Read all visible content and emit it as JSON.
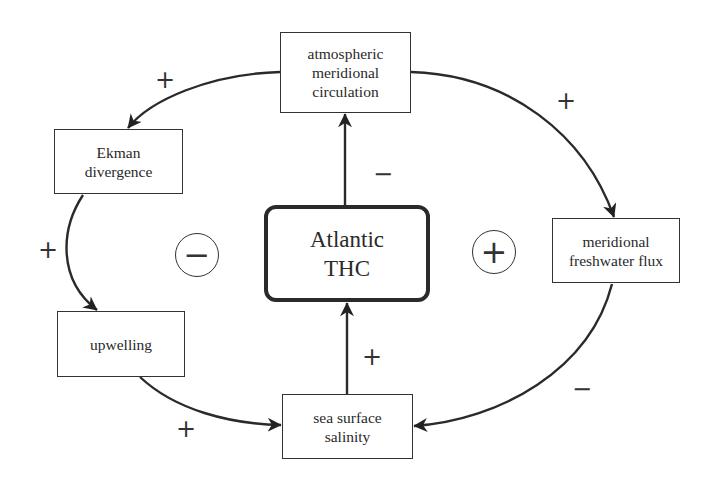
{
  "diagram": {
    "nodes": {
      "atmospheric": {
        "lines": [
          "atmospheric",
          "meridional",
          "circulation"
        ]
      },
      "ekman": {
        "lines": [
          "Ekman",
          "divergence"
        ]
      },
      "upwelling": {
        "lines": [
          "upwelling"
        ]
      },
      "thc": {
        "lines": [
          "Atlantic",
          "THC"
        ]
      },
      "freshwater": {
        "lines": [
          "meridional",
          "freshwater flux"
        ]
      },
      "salinity": {
        "lines": [
          "sea surface",
          "salinity"
        ]
      }
    },
    "edges": [
      {
        "from": "atmospheric meridional circulation",
        "to": "Ekman divergence",
        "sign": "+"
      },
      {
        "from": "Ekman divergence",
        "to": "upwelling",
        "sign": "+"
      },
      {
        "from": "upwelling",
        "to": "sea surface salinity",
        "sign": "+"
      },
      {
        "from": "sea surface salinity",
        "to": "Atlantic THC",
        "sign": "+"
      },
      {
        "from": "Atlantic THC",
        "to": "atmospheric meridional circulation",
        "sign": "−"
      },
      {
        "from": "atmospheric meridional circulation",
        "to": "meridional freshwater flux",
        "sign": "+"
      },
      {
        "from": "meridional freshwater flux",
        "to": "sea surface salinity",
        "sign": "−"
      }
    ],
    "loops": [
      {
        "name": "left-loop",
        "polarity": "−"
      },
      {
        "name": "right-loop",
        "polarity": "+"
      }
    ]
  }
}
